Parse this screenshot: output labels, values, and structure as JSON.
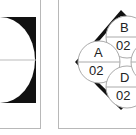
{
  "left_figure": {
    "description": "square with black fill and white circular cutout divided by horizontal line"
  },
  "right_figure": {
    "description": "diamond with black corner triangles and labeled circles",
    "circles": [
      {
        "label": "B",
        "value": "02"
      },
      {
        "label": "A",
        "value": "02"
      },
      {
        "label": "D",
        "value": "02"
      }
    ]
  },
  "colors": {
    "fill": "#111111",
    "line": "#b8b8b8",
    "background": "#ffffff"
  }
}
